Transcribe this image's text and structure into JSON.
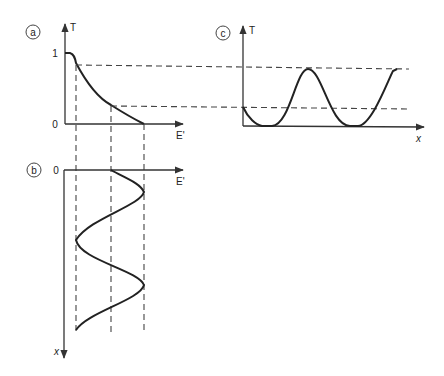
{
  "panels": {
    "a": {
      "label": "a",
      "y_axis": "T",
      "x_axis": "E'",
      "y_tick_top": "1",
      "y_tick_bottom": "0"
    },
    "b": {
      "label": "b",
      "y_axis": "x",
      "x_axis": "E'",
      "origin_tick": "0"
    },
    "c": {
      "label": "c",
      "y_axis": "T",
      "x_axis": "x"
    }
  },
  "colors": {
    "line": "#222222",
    "background": "#ffffff"
  }
}
